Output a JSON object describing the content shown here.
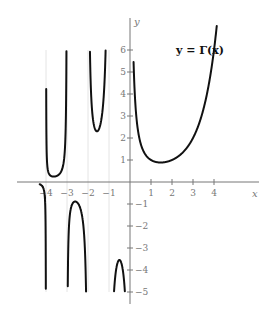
{
  "chart_data": {
    "type": "line",
    "title": "y = Γ(x)",
    "xlabel": "x",
    "ylabel": "y",
    "xlim": [
      -5.5,
      6.1
    ],
    "ylim": [
      -5.3,
      7.1
    ],
    "grid": false,
    "legend": "none",
    "x_ticks": [
      -4,
      -3,
      -2,
      -1,
      1,
      2,
      3,
      4
    ],
    "x_tick_labels": [
      "−4",
      "−3",
      "−2",
      "−1",
      "1",
      "2",
      "3",
      "4"
    ],
    "y_ticks": [
      -5,
      -4,
      -3,
      -2,
      -1,
      1,
      2,
      3,
      4,
      5,
      6
    ],
    "y_tick_labels": [
      "−5",
      "−4",
      "−3",
      "−2",
      "−1",
      "1",
      "2",
      "3",
      "4",
      "5",
      "6"
    ],
    "asymptotes_x": [
      -4,
      -3,
      -2,
      -1,
      0
    ],
    "y_clip": [
      -5,
      6
    ],
    "series": [
      {
        "name": "Gamma x>0",
        "domain": [
          0.17,
          4.35
        ]
      },
      {
        "name": "Gamma (-1,0)",
        "domain": [
          -0.98,
          -0.02
        ]
      },
      {
        "name": "Gamma (-2,-1)",
        "domain": [
          -1.99,
          -1.01
        ]
      },
      {
        "name": "Gamma (-3,-2)",
        "domain": [
          -2.99,
          -2.01
        ]
      },
      {
        "name": "Gamma (-4,-3)",
        "domain": [
          -3.99,
          -3.01
        ]
      },
      {
        "name": "Gamma (-5,-4)",
        "domain": [
          -4.3,
          -4.001
        ]
      }
    ],
    "annotations": [
      {
        "text": "y = Γ(x)",
        "x": 3.2,
        "y": 6.0
      }
    ]
  }
}
